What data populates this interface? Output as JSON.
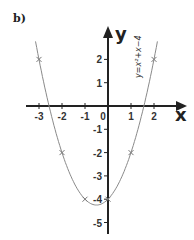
{
  "panel_label": "b)",
  "chart_data": {
    "type": "line",
    "title": "",
    "xlabel": "x",
    "ylabel": "y",
    "equation": "y=x²+x−4",
    "xlim": [
      -3.3,
      3.4
    ],
    "ylim": [
      -5.5,
      3.4
    ],
    "x_ticks": [
      -3,
      -2,
      -1,
      0,
      1,
      2
    ],
    "y_ticks": [
      2,
      1,
      -1,
      -2,
      -3,
      -4,
      -5
    ],
    "x_tick_labels": [
      "-3",
      "-2",
      "-1",
      "0",
      "1",
      "2"
    ],
    "y_tick_labels": [
      "2",
      "1",
      "-1",
      "-2",
      "-3",
      "-4",
      "-5"
    ],
    "origin_label": "0",
    "grid": false,
    "points": [
      {
        "x": -3,
        "y": 2
      },
      {
        "x": -2,
        "y": -2
      },
      {
        "x": -1,
        "y": -4
      },
      {
        "x": 0,
        "y": -4
      },
      {
        "x": 1,
        "y": -2
      },
      {
        "x": 2,
        "y": 2
      }
    ],
    "curve": {
      "a": 1,
      "b": 1,
      "c": -4,
      "x_range": [
        -3,
        2
      ]
    },
    "colors": {
      "axes": "#222222",
      "curve": "#8a8a8a",
      "markers": "#777777"
    }
  }
}
